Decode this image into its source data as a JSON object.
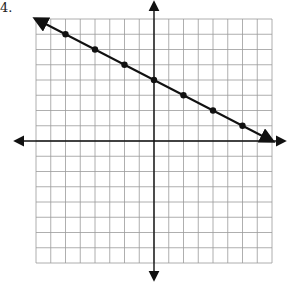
{
  "problem": {
    "number_label": "4."
  },
  "graph": {
    "grid_origin_px": [
      36,
      19
    ],
    "cell_w": 14.75,
    "cell_h": 15.25,
    "cols": 16,
    "rows": 16,
    "x_range": [
      -8,
      8
    ],
    "y_range": [
      -8,
      8
    ],
    "grid_color": "#9a9a9a",
    "axis_color": "#111111",
    "line_color": "#111111"
  },
  "chart_data": {
    "type": "line",
    "title": "",
    "xlabel": "",
    "ylabel": "",
    "xlim": [
      -8,
      8
    ],
    "ylim": [
      -8,
      8
    ],
    "grid": true,
    "series": [
      {
        "name": "line",
        "slope": -0.5,
        "intercept": 4,
        "points": [
          [
            -6,
            7
          ],
          [
            -4,
            6
          ],
          [
            -2,
            5
          ],
          [
            0,
            4
          ],
          [
            2,
            3
          ],
          [
            4,
            2
          ],
          [
            6,
            1
          ]
        ],
        "arrow_ends": [
          [
            -8,
            8
          ],
          [
            8,
            0
          ]
        ]
      }
    ]
  }
}
